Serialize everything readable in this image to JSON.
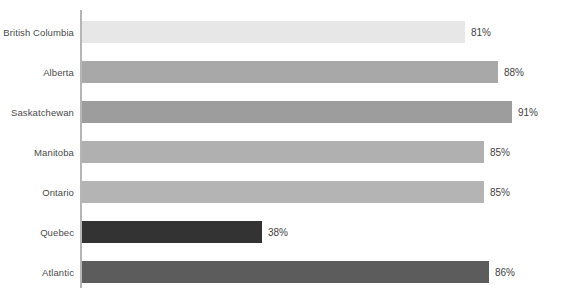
{
  "chart_data": {
    "type": "bar",
    "orientation": "horizontal",
    "title": "",
    "subtitle": "",
    "xlabel": "",
    "ylabel": "",
    "xlim": [
      0,
      100
    ],
    "grid": false,
    "legend": false,
    "value_suffix": "%",
    "categories": [
      "British Columbia",
      "Alberta",
      "Saskatchewan",
      "Manitoba",
      "Ontario",
      "Quebec",
      "Atlantic"
    ],
    "values": [
      81,
      88,
      91,
      85,
      85,
      38,
      86
    ],
    "value_labels": [
      "81%",
      "88%",
      "91%",
      "85%",
      "85%",
      "38%",
      "86%"
    ],
    "bar_colors": [
      "#e7e7e7",
      "#a8a8a8",
      "#9d9d9d",
      "#b0b0b0",
      "#b4b4b4",
      "#333333",
      "#5c5c5c"
    ],
    "axis_color": "#b5b5b5",
    "label_color": "#4a4a4a",
    "value_color": "#3f3f3f",
    "background": "#ffffff"
  }
}
